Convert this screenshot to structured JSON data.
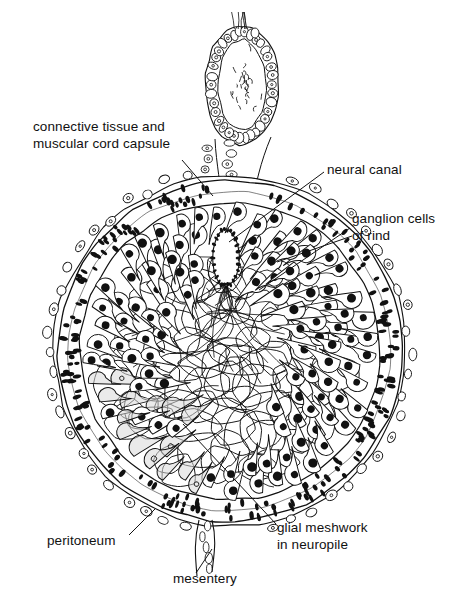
{
  "figure": {
    "kind": "histological-diagram",
    "background_color": "#ffffff",
    "ink_color": "#111111"
  },
  "labels": [
    {
      "id": "capsule",
      "text": "connective tissue and\nmuscular cord capsule",
      "align": "left"
    },
    {
      "id": "canal",
      "text": "neural canal",
      "align": "left"
    },
    {
      "id": "ganglion",
      "text": "ganglion cells\nof rind",
      "align": "left"
    },
    {
      "id": "peritoneum",
      "text": "peritoneum",
      "align": "left"
    },
    {
      "id": "mesentery",
      "text": "mesentery",
      "align": "left"
    },
    {
      "id": "glial",
      "text": "glial meshwork\nin neuropile",
      "align": "left"
    }
  ],
  "leaders": [
    {
      "id": "capsule-leader",
      "from": [
        182,
        160
      ],
      "to": [
        213,
        196
      ]
    },
    {
      "id": "canal-leader",
      "from": [
        324,
        172
      ],
      "to": [
        229,
        242
      ]
    },
    {
      "id": "ganglion-leader-a",
      "from": [
        350,
        228
      ],
      "to": [
        259,
        290
      ]
    },
    {
      "id": "ganglion-leader-b",
      "from": [
        352,
        236
      ],
      "to": [
        277,
        262
      ]
    },
    {
      "id": "peritoneum-leader",
      "from": [
        129,
        535
      ],
      "to": [
        155,
        509
      ]
    },
    {
      "id": "mesentery-leader",
      "from": [
        196,
        573
      ],
      "to": [
        212,
        549
      ]
    },
    {
      "id": "glial-leader",
      "from": [
        276,
        524
      ],
      "to": [
        183,
        424
      ]
    }
  ],
  "structures": {
    "cord_outline": {
      "center": [
        230,
        351
      ],
      "radius": 176,
      "name": "nerve cord cross-section"
    },
    "capsule_band": {
      "inner_radius": 150,
      "outer_radius": 172,
      "nucleus_count": 230,
      "name": "connective tissue and muscular capsule"
    },
    "peritoneum_ring": {
      "radius": 176,
      "cell_count": 52,
      "name": "peritoneum epithelium"
    },
    "neural_canal": {
      "center": [
        226,
        258
      ],
      "width": 26,
      "height": 56,
      "name": "neural canal lumen"
    },
    "ganglion_cells": {
      "count": 150,
      "nucleus_color": "#111111",
      "name": "ganglion cells of rind"
    },
    "pale_cells": {
      "count": 34,
      "fill": "#d8d8d8",
      "name": "pale stippled cells"
    },
    "neuropile_mesh": {
      "center": [
        222,
        368
      ],
      "radius": 112,
      "name": "glial meshwork in neuropile"
    },
    "dorsal_loop": {
      "center": [
        242,
        85
      ],
      "width": 74,
      "height": 120,
      "name": "dorsal mesentery loop"
    },
    "mesentery_strand": {
      "top": [
        205,
        520
      ],
      "bottom": [
        204,
        576
      ],
      "name": "ventral mesentery strand"
    }
  }
}
